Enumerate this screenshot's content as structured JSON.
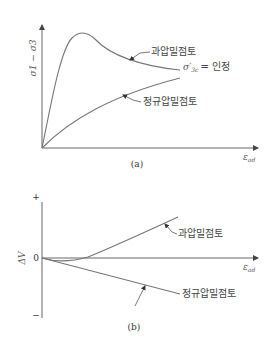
{
  "panel_a": {
    "caption": "(a)",
    "y_axis_label": "σ1 − σ3",
    "x_axis_label": "εad",
    "x_axis_label_main": "ε",
    "x_axis_label_sub": "ad",
    "curves": [
      {
        "name": "over-consolidated",
        "label": "과압밀점토",
        "shape": "peak then softening"
      },
      {
        "name": "normally-consolidated",
        "label": "정규압밀점토",
        "shape": "monotonic hardening"
      }
    ],
    "annotation": {
      "symbol": "σ′",
      "subscript": "3c",
      "text": "= 인정"
    }
  },
  "panel_b": {
    "caption": "(b)",
    "y_axis_label": "ΔV",
    "y_plus": "+",
    "y_minus": "−",
    "y_zero": "0",
    "x_axis_label_main": "ε",
    "x_axis_label_sub": "ad",
    "curves": [
      {
        "name": "over-consolidated",
        "label": "과압밀점토",
        "shape": "slight contraction then dilation"
      },
      {
        "name": "normally-consolidated",
        "label": "정규압밀점토",
        "shape": "contraction"
      }
    ]
  },
  "colors": {
    "line": "#777777",
    "axis": "#666666",
    "text": "#444444"
  }
}
